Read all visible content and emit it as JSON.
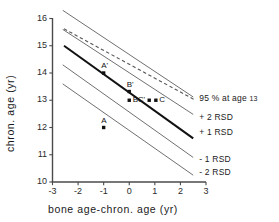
{
  "chart_data": {
    "type": "line",
    "title": "",
    "xlabel": "bone age-chron. age (yr)",
    "ylabel": "chron. age (yr)",
    "xlim": [
      -3,
      3
    ],
    "ylim": [
      10,
      16
    ],
    "xticks": [
      "-3",
      "-2",
      "-1",
      "0",
      "1",
      "2",
      "3"
    ],
    "xtick_values": [
      -3,
      -2,
      -1,
      0,
      1,
      2,
      3
    ],
    "yticks": [
      "10",
      "11",
      "12",
      "13",
      "14",
      "15",
      "16"
    ],
    "ytick_values": [
      10,
      11,
      12,
      13,
      14,
      15,
      16
    ],
    "grid": false,
    "legend_position": "right-inline",
    "series": [
      {
        "name": "95 % at age 13",
        "style": "dashed",
        "weight": "thin",
        "x": [
          -2.55,
          2.55
        ],
        "y": [
          15.62,
          13.02
        ]
      },
      {
        "name": "+2 RSD",
        "style": "solid",
        "weight": "thin",
        "x": [
          -2.6,
          2.5
        ],
        "y": [
          16.3,
          13.12
        ]
      },
      {
        "name": "+1 RSD",
        "style": "solid",
        "weight": "thin",
        "x": [
          -2.6,
          2.5
        ],
        "y": [
          15.6,
          12.48
        ]
      },
      {
        "name": "mean",
        "style": "solid",
        "weight": "bold",
        "x": [
          -2.55,
          2.5
        ],
        "y": [
          15.0,
          11.6
        ]
      },
      {
        "name": "-1 RSD",
        "style": "solid",
        "weight": "thin",
        "x": [
          -2.6,
          2.5
        ],
        "y": [
          14.3,
          10.9
        ]
      },
      {
        "name": "-2 RSD",
        "style": "solid",
        "weight": "thin",
        "x": [
          -2.6,
          2.5
        ],
        "y": [
          13.6,
          10.25
        ]
      }
    ],
    "points": [
      {
        "label": "A",
        "x": -1.0,
        "y": 12.0,
        "label_pos": "above"
      },
      {
        "label": "A'",
        "x": -1.0,
        "y": 14.0,
        "label_pos": "above"
      },
      {
        "label": "B",
        "x": 0.0,
        "y": 13.0,
        "label_pos": "right"
      },
      {
        "label": "B'",
        "x": 0.0,
        "y": 13.32,
        "label_pos": "above"
      },
      {
        "label": "C'",
        "x": 0.78,
        "y": 13.0,
        "label_pos": "left"
      },
      {
        "label": "C",
        "x": 1.04,
        "y": 13.0,
        "label_pos": "right"
      }
    ],
    "band_labels": [
      {
        "text": "95 % at age ",
        "sub": "13",
        "x": 2.62,
        "y": 13.06
      },
      {
        "text": "+ 2 RSD",
        "sub": "",
        "x": 2.62,
        "y": 12.35
      },
      {
        "text": "+ 1 RSD",
        "sub": "",
        "x": 2.62,
        "y": 11.78
      },
      {
        "text": "- 1 RSD",
        "sub": "",
        "x": 2.62,
        "y": 10.8
      },
      {
        "text": "- 2 RSD",
        "sub": "",
        "x": 2.62,
        "y": 10.32
      }
    ],
    "colors": {
      "axis": "#4a4a4a",
      "line_thin": "#707070",
      "line_bold": "#111111",
      "dashed": "#555555",
      "text": "#1a1a1a",
      "point": "#111111",
      "background": "#ffffff"
    }
  }
}
